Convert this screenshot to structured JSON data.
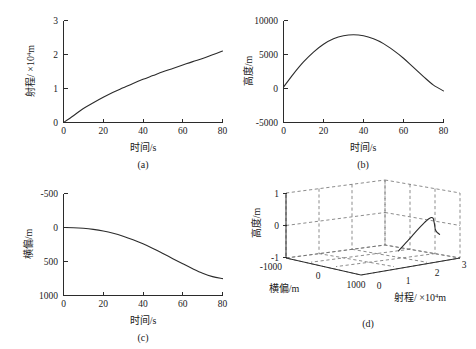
{
  "figure": {
    "background": "#ffffff",
    "line_color": "#2b2b2b",
    "grid_color": "#6f6f6f"
  },
  "chart_data": [
    {
      "id": "a",
      "type": "line",
      "caption": "(a)",
      "title": "",
      "xlabel": "时间/s",
      "ylabel_main": "射程/ ×10",
      "ylabel_sup": "4",
      "ylabel_tail": "m",
      "ylabel_full": "射程/ ×10⁴m",
      "xlim": [
        0,
        80
      ],
      "ylim": [
        0,
        3
      ],
      "xticks": [
        0,
        20,
        40,
        60,
        80
      ],
      "xticklabels": [
        "0",
        "20",
        "40",
        "60",
        "80"
      ],
      "yticks": [
        0,
        1,
        2,
        3
      ],
      "yticklabels": [
        "0",
        "1",
        "2",
        "3"
      ],
      "y_inverted": false,
      "grid": false,
      "legend": "none",
      "x": [
        0,
        5,
        10,
        15,
        20,
        25,
        30,
        35,
        40,
        45,
        50,
        55,
        60,
        65,
        70,
        75,
        80
      ],
      "y": [
        0,
        0.2,
        0.41,
        0.58,
        0.74,
        0.89,
        1.02,
        1.15,
        1.27,
        1.38,
        1.49,
        1.59,
        1.69,
        1.79,
        1.88,
        1.99,
        2.1
      ]
    },
    {
      "id": "b",
      "type": "line",
      "caption": "(b)",
      "title": "",
      "xlabel": "时间/s",
      "ylabel_full": "高度/m",
      "xlim": [
        0,
        80
      ],
      "ylim": [
        -5000,
        10000
      ],
      "xticks": [
        0,
        20,
        40,
        60,
        80
      ],
      "xticklabels": [
        "0",
        "20",
        "40",
        "60",
        "80"
      ],
      "yticks": [
        -5000,
        0,
        5000,
        10000
      ],
      "yticklabels": [
        "-5000",
        "0",
        "5000",
        "10000"
      ],
      "y_inverted": false,
      "grid": false,
      "legend": "none",
      "x": [
        0,
        5,
        10,
        15,
        20,
        25,
        30,
        35,
        40,
        45,
        50,
        55,
        60,
        65,
        70,
        75,
        80
      ],
      "y": [
        200,
        2150,
        3900,
        5350,
        6500,
        7300,
        7750,
        7900,
        7750,
        7300,
        6600,
        5600,
        4450,
        3100,
        1750,
        500,
        -350
      ]
    },
    {
      "id": "c",
      "type": "line",
      "caption": "(c)",
      "title": "",
      "xlabel": "时间/s",
      "ylabel_full": "横偏/m",
      "xlim": [
        0,
        80
      ],
      "ylim": [
        -500,
        1000
      ],
      "xticks": [
        0,
        20,
        40,
        60,
        80
      ],
      "xticklabels": [
        "0",
        "20",
        "40",
        "60",
        "80"
      ],
      "yticks": [
        -500,
        0,
        500,
        1000
      ],
      "yticklabels": [
        "-500",
        "0",
        "500",
        "1000"
      ],
      "y_inverted": true,
      "grid": false,
      "legend": "none",
      "x": [
        0,
        5,
        10,
        15,
        20,
        25,
        30,
        35,
        40,
        45,
        50,
        55,
        60,
        65,
        70,
        75,
        80
      ],
      "y": [
        0,
        3,
        12,
        28,
        52,
        85,
        128,
        180,
        240,
        308,
        382,
        458,
        533,
        606,
        672,
        722,
        752
      ]
    },
    {
      "id": "d",
      "type": "line3d",
      "caption": "(d)",
      "title": "",
      "xlabel_main": "射程/ ×10",
      "xlabel_sup": "4",
      "xlabel_tail": "m",
      "xlabel_full": "射程/ ×10⁴m",
      "ylabel_full": "横偏/m",
      "zlabel_full": "高度/m",
      "xlim": [
        0,
        3
      ],
      "ylim": [
        -1000,
        1000
      ],
      "zlim": [
        -1,
        1
      ],
      "xticklabels": [
        "0",
        "1",
        "2",
        "3"
      ],
      "yticklabels": [
        "-1000",
        "0",
        "1000"
      ],
      "zticklabels": [
        "-1",
        "0",
        "1"
      ],
      "grid": true,
      "legend": "none",
      "x": [
        0,
        0.21,
        0.41,
        0.58,
        0.74,
        0.89,
        1.02,
        1.15,
        1.27,
        1.38,
        1.49,
        1.59,
        1.69,
        1.79,
        1.88,
        1.99,
        2.1
      ],
      "y": [
        0,
        3,
        12,
        28,
        52,
        85,
        128,
        180,
        240,
        308,
        382,
        458,
        533,
        606,
        672,
        722,
        752
      ],
      "z": [
        0.02,
        0.215,
        0.39,
        0.535,
        0.65,
        0.73,
        0.775,
        0.79,
        0.775,
        0.73,
        0.66,
        0.56,
        0.445,
        0.31,
        0.175,
        0.05,
        -0.035
      ]
    }
  ]
}
